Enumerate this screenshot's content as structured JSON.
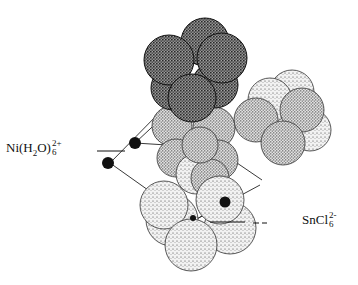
{
  "diagram": {
    "type": "molecular packing diagram",
    "labels": {
      "nickel_complex": {
        "base": "Ni(H",
        "sub1": "2",
        "mid": "O)",
        "sub2": "6",
        "charge": "2+"
      },
      "tin_complex": {
        "base": "SnCl",
        "sub": "6",
        "charge": "2-"
      }
    },
    "colors": {
      "ink": "#111111",
      "dark_sphere": "#3a3a3a",
      "light_sphere": "#9a9a9a",
      "background": "#ffffff"
    }
  }
}
